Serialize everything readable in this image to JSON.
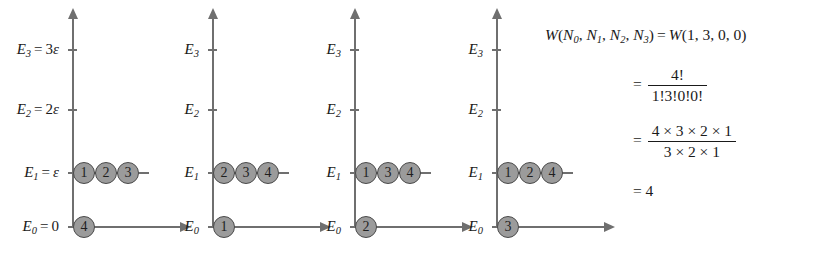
{
  "diagram": {
    "energy_levels": [
      {
        "key": "E3",
        "symbol": "E",
        "sub": "3",
        "value_text": "3ε",
        "full_label": "E3 = 3ε"
      },
      {
        "key": "E2",
        "symbol": "E",
        "sub": "2",
        "value_text": "2ε",
        "full_label": "E2 = 2ε"
      },
      {
        "key": "E1",
        "symbol": "E",
        "sub": "1",
        "value_text": "ε",
        "full_label": "E1 = ε"
      },
      {
        "key": "E0",
        "symbol": "E",
        "sub": "0",
        "value_text": "0",
        "full_label": "E0 = 0"
      }
    ],
    "panels": [
      {
        "index": 1,
        "labels_show_values": true,
        "occupancy": {
          "E3": [],
          "E2": [],
          "E1": [
            "1",
            "2",
            "3"
          ],
          "E0": [
            "4"
          ]
        }
      },
      {
        "index": 2,
        "labels_show_values": false,
        "occupancy": {
          "E3": [],
          "E2": [],
          "E1": [
            "2",
            "3",
            "4"
          ],
          "E0": [
            "1"
          ]
        }
      },
      {
        "index": 3,
        "labels_show_values": false,
        "occupancy": {
          "E3": [],
          "E2": [],
          "E1": [
            "1",
            "3",
            "4"
          ],
          "E0": [
            "2"
          ]
        }
      },
      {
        "index": 4,
        "labels_show_values": false,
        "occupancy": {
          "E3": [],
          "E2": [],
          "E1": [
            "1",
            "2",
            "4"
          ],
          "E0": [
            "3"
          ]
        }
      }
    ],
    "colors": {
      "axis": "#6f6f6f",
      "ball_fill": "#9b9b9b",
      "ball_stroke": "#4a4a4a",
      "text": "#1a1a1a",
      "background": "#ffffff"
    }
  },
  "equation": {
    "line1": {
      "w_symbol": "W",
      "args": [
        "N0",
        "N1",
        "N2",
        "N3"
      ],
      "equals": "=",
      "rhs_symbol": "W",
      "rhs_args": [
        "1",
        "3",
        "0",
        "0"
      ],
      "text": "W(N0, N1, N2, N3) = W(1, 3, 0, 0)"
    },
    "line2": {
      "equals": "=",
      "numerator": "4!",
      "denominator": "1!3!0!0!",
      "text": "= 4! / 1!3!0!0!"
    },
    "line3": {
      "equals": "=",
      "numerator": "4 × 3 × 2 × 1",
      "denominator": "3 × 2 × 1",
      "text": "= (4×3×2×1) / (3×2×1)"
    },
    "line4": {
      "equals": "=",
      "result": "4",
      "text": "= 4"
    }
  }
}
